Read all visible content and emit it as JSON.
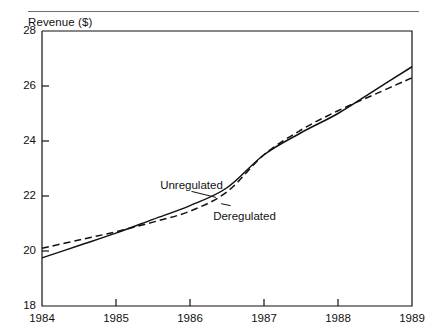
{
  "figure": {
    "background": "#ffffff",
    "ink": "#111111",
    "rule_color": "#6f6f6f"
  },
  "chart_data": {
    "type": "line",
    "title": "",
    "ylabel": "Revenue ($)",
    "xlabel": "",
    "xlim": [
      1984,
      1989
    ],
    "ylim": [
      18,
      28
    ],
    "grid": false,
    "legend": "inline-annotations",
    "xticks": [
      1984,
      1985,
      1986,
      1987,
      1988,
      1989
    ],
    "xtick_labels": [
      "1984",
      "1985",
      "1986",
      "1987",
      "1988",
      "1989"
    ],
    "yticks": [
      18,
      20,
      22,
      24,
      26,
      28
    ],
    "ytick_labels": [
      "18",
      "20",
      "22",
      "24",
      "26",
      "28"
    ],
    "x": [
      1984,
      1984.5,
      1985,
      1985.5,
      1986,
      1986.5,
      1987,
      1987.5,
      1988,
      1988.5,
      1989
    ],
    "series": [
      {
        "name": "Unregulated",
        "style": "solid",
        "color": "#111111",
        "values": [
          19.75,
          20.2,
          20.65,
          21.15,
          21.65,
          22.3,
          23.5,
          24.3,
          25.0,
          25.85,
          26.7
        ]
      },
      {
        "name": "Deregulated",
        "style": "dashed",
        "color": "#111111",
        "values": [
          20.1,
          20.4,
          20.7,
          21.05,
          21.45,
          22.15,
          23.5,
          24.4,
          25.1,
          25.7,
          26.3
        ]
      }
    ],
    "annotations": [
      {
        "text": "Unregulated",
        "x": 1986.02,
        "y": 22.35,
        "leader_to": {
          "x": 1986.35,
          "y": 21.95
        }
      },
      {
        "text": "Deregulated",
        "x": 1986.55,
        "y": 21.25,
        "leader_to": {
          "x": 1986.42,
          "y": 21.72
        }
      }
    ]
  }
}
